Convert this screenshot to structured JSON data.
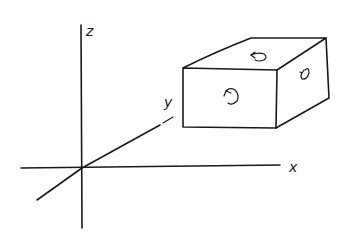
{
  "diagram": {
    "type": "3d-axes-with-box",
    "axes": {
      "z_label": "z",
      "y_label": "y",
      "x_label": "x"
    },
    "box": {
      "faces": [
        {
          "name": "front",
          "symbol": "counterclockwise-arrow"
        },
        {
          "name": "top",
          "symbol": "counterclockwise-arrow"
        },
        {
          "name": "right",
          "symbol": "counterclockwise-arrow"
        }
      ]
    },
    "colors": {
      "stroke": "#1a1a1a",
      "background": "#ffffff"
    }
  }
}
